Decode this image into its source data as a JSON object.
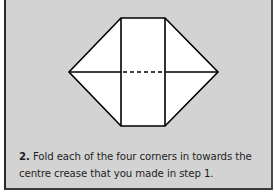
{
  "step": {
    "number": "2.",
    "instruction_line1": "Fold each of the four corners in towards the",
    "instruction_line2": "centre crease that you made in step 1."
  },
  "diagram": {
    "fill_color": "#ffffff",
    "line_color": "#000000",
    "background_color": "#d3d3d3"
  }
}
